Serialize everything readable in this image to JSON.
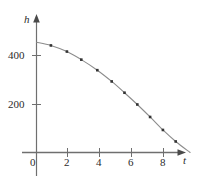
{
  "figure": {
    "name": "height-vs-time-graph",
    "background_color": "#ffffff",
    "axis_color": "#6f6f6f",
    "curve_color": "#8c8c8c",
    "marker_color": "#333333",
    "text_color": "#2b2b2b"
  },
  "axes": {
    "y_axis_label": "h",
    "x_axis_label": "t",
    "origin_label": "0",
    "y_ticks": [
      {
        "value": 200,
        "label": "200"
      },
      {
        "value": 400,
        "label": "400"
      }
    ],
    "x_ticks": [
      {
        "value": 2,
        "label": "2"
      },
      {
        "value": 4,
        "label": "4"
      },
      {
        "value": 6,
        "label": "6"
      },
      {
        "value": 8,
        "label": "8"
      }
    ]
  },
  "chart_data": {
    "type": "scatter",
    "title": "",
    "xlabel": "t",
    "ylabel": "h",
    "xlim": [
      0,
      10.2
    ],
    "ylim": [
      0,
      500
    ],
    "grid": false,
    "legend": "none",
    "x": [
      0,
      1,
      2,
      3,
      4,
      5,
      6,
      7,
      8,
      9,
      9.6
    ],
    "y": [
      450,
      434,
      386,
      306,
      194,
      50,
      0,
      0,
      0,
      0,
      0
    ],
    "series": [
      {
        "name": "height",
        "marker": "square",
        "line": "smooth-curve",
        "points": [
          {
            "t": 0.0,
            "h": 450
          },
          {
            "t": 0.9,
            "h": 437
          },
          {
            "t": 1.9,
            "h": 412
          },
          {
            "t": 2.8,
            "h": 379
          },
          {
            "t": 3.8,
            "h": 336
          },
          {
            "t": 4.7,
            "h": 290
          },
          {
            "t": 5.5,
            "h": 244
          },
          {
            "t": 6.3,
            "h": 196
          },
          {
            "t": 7.1,
            "h": 145
          },
          {
            "t": 7.9,
            "h": 92
          },
          {
            "t": 8.7,
            "h": 45
          },
          {
            "t": 9.6,
            "h": 0
          }
        ]
      }
    ]
  }
}
